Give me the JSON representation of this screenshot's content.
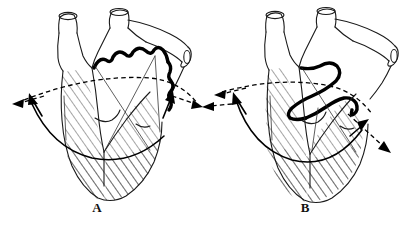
{
  "figure": {
    "caption_present": false,
    "background_color": "#ffffff",
    "ink_color": "#000000",
    "panel_count": 2
  },
  "panels": [
    {
      "id": "panel-a",
      "label": "A",
      "label_x": 97,
      "label_y": 212,
      "description": "heart-diagram-diastole",
      "arrows": [
        {
          "name": "dashed-left-arrow",
          "style": "dashed",
          "direction": "left",
          "tip_x": 12,
          "tip_y": 104
        },
        {
          "name": "solid-left-arrow",
          "style": "solid",
          "direction": "up-left",
          "tip_x": 30,
          "tip_y": 96
        },
        {
          "name": "dashed-right-arrow",
          "style": "dashed",
          "direction": "right",
          "tip_x": 200,
          "tip_y": 106
        },
        {
          "name": "solid-right-arrow",
          "style": "solid",
          "direction": "up-right",
          "tip_x": 171,
          "tip_y": 92
        }
      ],
      "valve_plane_style": "dashed",
      "thick_scalloped_curve": true
    },
    {
      "id": "panel-b",
      "label": "B",
      "label_x": 305,
      "label_y": 212,
      "description": "heart-diagram-systole",
      "arrows": [
        {
          "name": "dashed-left-upper-arrow",
          "style": "dashed",
          "direction": "left",
          "tip_x": 215,
          "tip_y": 95
        },
        {
          "name": "dashed-left-lower-arrow",
          "style": "dashed",
          "direction": "left-down",
          "tip_x": 204,
          "tip_y": 108
        },
        {
          "name": "solid-left-arrow",
          "style": "solid",
          "direction": "up-left",
          "tip_x": 234,
          "tip_y": 94
        },
        {
          "name": "dashed-right-arrow",
          "style": "dashed",
          "direction": "down-right",
          "tip_x": 389,
          "tip_y": 151
        },
        {
          "name": "solid-right-arrow",
          "style": "solid",
          "direction": "up-right",
          "tip_x": 363,
          "tip_y": 124
        }
      ],
      "valve_plane_style": "dashed",
      "thick_looping_curve": true
    }
  ],
  "colors": {
    "ink": "#000000",
    "hatch": "#2a2a2a",
    "paper": "#ffffff"
  }
}
